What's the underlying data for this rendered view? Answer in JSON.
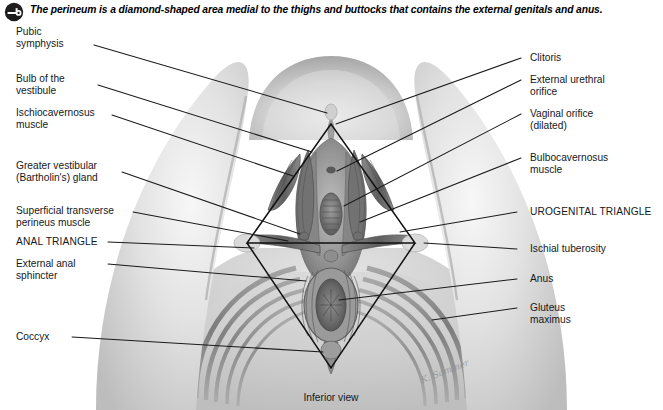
{
  "figure": {
    "header": {
      "icon": "key-circle-icon",
      "text": "The perineum is a diamond-shaped area medial to the thighs and buttocks that contains the external genitals and anus."
    },
    "caption": "Inferior view",
    "signature": "K. Sommer",
    "colors": {
      "ink": "#15181c",
      "leader_line": "#1a1a1a",
      "triangle_outline": "#111111",
      "background": "#ffffff",
      "tissue_light": "#d9d9d9",
      "tissue_mid": "#9a9a9a",
      "tissue_dark": "#5c5c5c"
    },
    "labels_left": [
      {
        "id": "pubic-symphysis",
        "text": "Pubic\nsymphysis"
      },
      {
        "id": "bulb-of-the-vestibule",
        "text": "Bulb of the\nvestibule"
      },
      {
        "id": "ischiocavernosus-muscle",
        "text": "Ischiocavernosus\nmuscle"
      },
      {
        "id": "greater-vestibular-gland",
        "text": "Greater vestibular\n(Bartholin's) gland"
      },
      {
        "id": "superficial-transverse-perineus-muscle",
        "text": "Superficial transverse\nperineus muscle"
      },
      {
        "id": "anal-triangle",
        "text": "ANAL TRIANGLE"
      },
      {
        "id": "external-anal-sphincter",
        "text": "External anal\nsphincter"
      },
      {
        "id": "coccyx",
        "text": "Coccyx"
      }
    ],
    "labels_right": [
      {
        "id": "clitoris",
        "text": "Clitoris"
      },
      {
        "id": "external-urethral-orifice",
        "text": "External urethral\norifice"
      },
      {
        "id": "vaginal-orifice",
        "text": "Vaginal orifice\n(dilated)"
      },
      {
        "id": "bulbocavernosus-muscle",
        "text": "Bulbocavernosus\nmuscle"
      },
      {
        "id": "urogenital-triangle",
        "text": "UROGENITAL TRIANGLE"
      },
      {
        "id": "ischial-tuberosity",
        "text": "Ischial tuberosity"
      },
      {
        "id": "anus",
        "text": "Anus"
      },
      {
        "id": "gluteus-maximus",
        "text": "Gluteus\nmaximus"
      }
    ]
  }
}
